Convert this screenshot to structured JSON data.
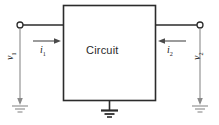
{
  "figure": {
    "name": "two-port-circuit-diagram",
    "background_color": "#ffffff",
    "line_color": "#2b2b2b",
    "box": {
      "label": "Circuit",
      "border_color": "#2b2b2b",
      "fill": "#ffffff"
    },
    "labels": {
      "circuit": "Circuit",
      "current_left": "i",
      "current_left_subscript": "1",
      "current_right": "i",
      "current_right_subscript": "2",
      "voltage_left": "v",
      "voltage_left_subscript": "1",
      "voltage_right": "v",
      "voltage_right_subscript": "2"
    },
    "terminals": [
      {
        "name": "left-terminal",
        "type": "open-circle"
      },
      {
        "name": "right-terminal",
        "type": "open-circle"
      }
    ],
    "grounds": [
      {
        "name": "left-ground",
        "symbol": "earth-ground"
      },
      {
        "name": "center-ground",
        "symbol": "earth-ground"
      },
      {
        "name": "right-ground",
        "symbol": "earth-ground"
      }
    ],
    "arrows": [
      {
        "name": "current-arrow-left",
        "direction": "right"
      },
      {
        "name": "current-arrow-right",
        "direction": "left"
      },
      {
        "name": "voltage-arrow-left",
        "direction": "down"
      },
      {
        "name": "voltage-arrow-right",
        "direction": "down"
      }
    ]
  }
}
